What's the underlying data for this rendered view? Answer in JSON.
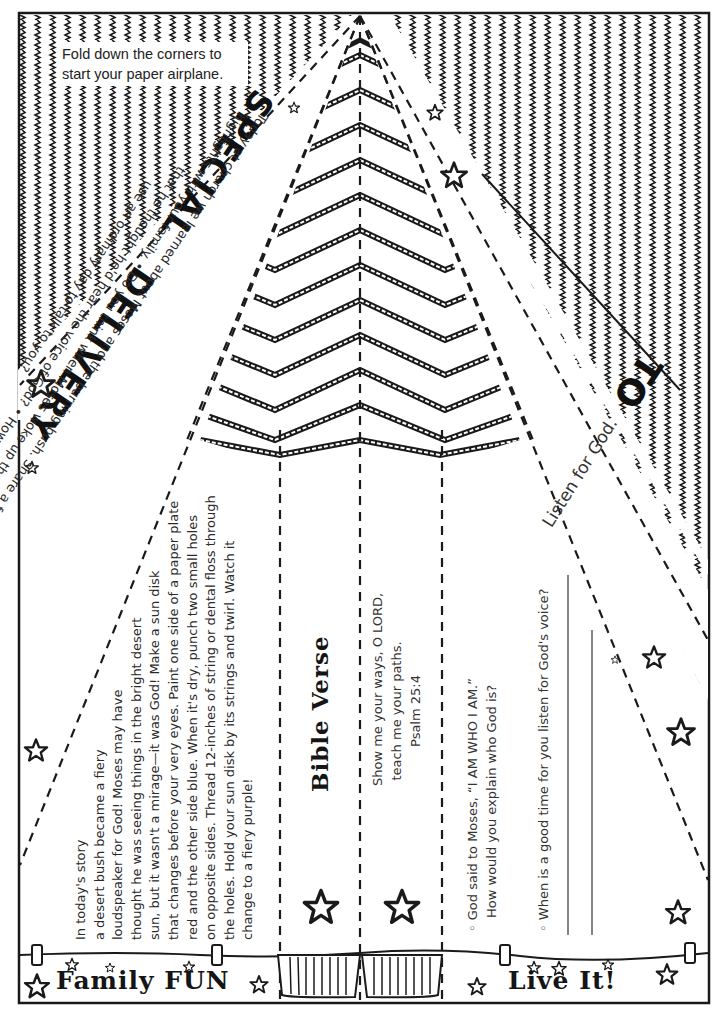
{
  "page": {
    "colors": {
      "ink": "#1a1a1a",
      "paper": "#ffffff",
      "muted_text": "#333333"
    }
  },
  "fold_instruction": {
    "line1": "Fold down the corners to",
    "line2": "start your paper airplane."
  },
  "headline": {
    "word1": "SPECIAL",
    "word2": "DELIVERY"
  },
  "intro": {
    "lines": [
      "Today at church we learned about Moses and the burning bush. Share a few of the story",
      "highlights with your family. • Do you think when Moses woke up that desert day",
      "that he thought he'd hear the voice of God? • How might God",
      "use an ordinary day to talk to you?"
    ]
  },
  "family_fun": {
    "title": "Family FUN",
    "lines": [
      "In today's story",
      "a desert bush became a fiery",
      "loudspeaker for God! Moses may have",
      "thought he was seeing things in the bright desert",
      "sun, but it wasn't a mirage—it was God! Make a sun disk",
      "that changes before your very eyes. Paint one side of a paper plate",
      "red and the other side blue.  When it's dry, punch two small holes",
      "on opposite sides. Thread 12-inches of string or dental floss through",
      "the holes. Hold your sun disk by its strings and twirl. Watch it",
      "change to a fiery purple!"
    ]
  },
  "bible_verse": {
    "title": "Bible Verse",
    "lines": [
      "Show me your ways, O LORD,",
      "teach me your paths.",
      "Psalm 25:4"
    ]
  },
  "live_it": {
    "title": "Live It!",
    "questions": [
      {
        "line1": "◦ God said to Moses, “I AM WHO I AM.”",
        "line2": "How would you explain who God is?"
      },
      {
        "line1": "◦ When is a good time for you listen for God's voice?"
      }
    ]
  },
  "address": {
    "to_label": "TO",
    "tagline": "Listen for God."
  },
  "icons": [
    "star-outline-icon",
    "chevron-pattern",
    "zigzag-pattern",
    "cup-icon",
    "clip-tab-icon"
  ]
}
